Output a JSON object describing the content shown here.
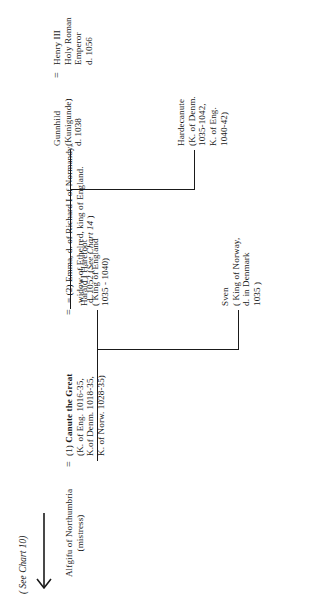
{
  "chart": {
    "title_reference": "( See Chart 10)",
    "type": "genealogy-family-tree",
    "orientation": "rotated-90-ccw"
  },
  "people": {
    "canute": {
      "name": "Canute the Great",
      "detail_1": "(K. of Eng. 1016-35,",
      "detail_2": "K.of Denm. 1018-35,",
      "detail_3": "K. of Norw. 1028-35)",
      "marriage_marker": "(1)"
    },
    "alfgifu": {
      "name": "Alfgifu of Northumbria",
      "detail_1": "(mistress)"
    },
    "emma": {
      "marriage_marker": "(2)",
      "line_1": "= (2) Emma,  d.  of  Richard I of Normandy,",
      "line_2": "widow of Ethelred, king of England.",
      "line_3a": "d. 1052 (",
      "line_3b": "See Chart 14",
      "line_3c": " )"
    },
    "sven": {
      "name": "Sven",
      "detail_1": "( King of Norway,",
      "detail_2": "d. in Denmark",
      "detail_3": "1035 )"
    },
    "harald": {
      "name": "Harald  I  Harefoot",
      "detail_1": "( King of England",
      "detail_2": "1035 - 1040)"
    },
    "hardecanute": {
      "name": "Hardecanute",
      "detail_1": "(K. of Denm.",
      "detail_2": "1035-1042,",
      "detail_3": "K. of Eng.",
      "detail_4": "1040-42)"
    },
    "gunnhild": {
      "name": "Gunnhild",
      "detail_1": "(Kunigunde)",
      "detail_2": "d. 1038"
    },
    "henry3": {
      "name": "Henry III",
      "detail_1": "Holy Roman",
      "detail_2": "Emperor",
      "detail_3": "d. 1056"
    }
  },
  "symbols": {
    "equals_canute_alfgifu": "=",
    "equals_gunnhild_henry": "=",
    "equals_canute_emma": "="
  },
  "colors": {
    "ink": "#1a1a1a",
    "background": "#ffffff"
  }
}
